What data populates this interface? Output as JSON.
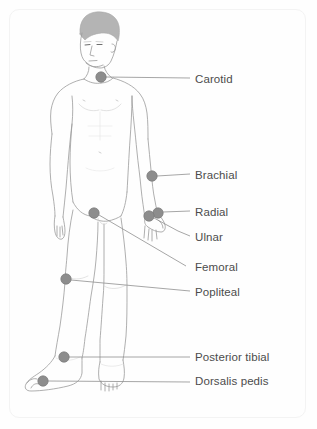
{
  "diagram": {
    "colors": {
      "label_text": "#4c4c4c",
      "marker_fill": "#8d8d8d",
      "marker_stroke": "#7a7a7a",
      "leader_line": "#8f8f8f",
      "body_outline": "#9a9a9a",
      "hair_fill": "#b4b4b4",
      "frame_border": "#f3f3f3",
      "background": "#fefefe"
    },
    "frame": {
      "x": 9,
      "y": 9,
      "width": 297,
      "height": 409,
      "radius": 10
    },
    "labels": [
      {
        "id": "carotid",
        "text": "Carotid",
        "text_x": 195,
        "text_y": 73,
        "marker_x": 101,
        "marker_y": 77,
        "marker_r": 5.2,
        "leader": [
          [
            106,
            77
          ],
          [
            190,
            78
          ]
        ]
      },
      {
        "id": "brachial",
        "text": "Brachial",
        "text_x": 195,
        "text_y": 169,
        "marker_x": 152,
        "marker_y": 176,
        "marker_r": 5.2,
        "leader": [
          [
            157,
            176
          ],
          [
            190,
            174
          ]
        ]
      },
      {
        "id": "radial",
        "text": "Radial",
        "text_x": 195,
        "text_y": 206,
        "marker_x": 158,
        "marker_y": 213,
        "marker_r": 5.2,
        "leader": [
          [
            163,
            212
          ],
          [
            190,
            211
          ]
        ]
      },
      {
        "id": "ulnar",
        "text": "Ulnar",
        "text_x": 195,
        "text_y": 231,
        "marker_x": 149,
        "marker_y": 216,
        "marker_r": 5.2,
        "leader": [
          [
            154,
            218
          ],
          [
            178,
            231
          ],
          [
            190,
            236
          ]
        ]
      },
      {
        "id": "femoral",
        "text": "Femoral",
        "text_x": 195,
        "text_y": 261,
        "marker_x": 94,
        "marker_y": 213,
        "marker_r": 5.2,
        "leader": [
          [
            99,
            215
          ],
          [
            186,
            266
          ]
        ]
      },
      {
        "id": "popliteal",
        "text": "Popliteal",
        "text_x": 195,
        "text_y": 286,
        "marker_x": 66,
        "marker_y": 279,
        "marker_r": 5.2,
        "leader": [
          [
            71,
            280
          ],
          [
            190,
            291
          ]
        ]
      },
      {
        "id": "posterior-tibial",
        "text": "Posterior tibial",
        "text_x": 195,
        "text_y": 351,
        "marker_x": 64,
        "marker_y": 357,
        "marker_r": 5.2,
        "leader": [
          [
            69,
            357
          ],
          [
            190,
            357
          ]
        ]
      },
      {
        "id": "dorsalis-pedis",
        "text": "Dorsalis pedis",
        "text_x": 195,
        "text_y": 375,
        "marker_x": 43,
        "marker_y": 381,
        "marker_r": 5.2,
        "leader": [
          [
            48,
            381
          ],
          [
            190,
            382
          ]
        ]
      }
    ]
  }
}
